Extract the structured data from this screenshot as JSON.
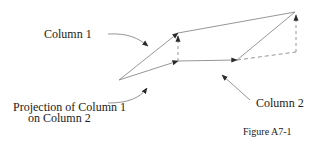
{
  "diagram": {
    "caption": "Figure A7-1",
    "labels": {
      "column1": "Column 1",
      "column2": "Column 2",
      "projection_line1": "Projection of Column 1",
      "projection_line2": "on Column 2"
    },
    "colors": {
      "line": "#8a8a8a",
      "arrowhead": "#2a2a2a",
      "text": "#222222",
      "background": "#ffffff"
    },
    "points": {
      "origin": [
        119,
        80
      ],
      "column1_tip": [
        178,
        33
      ],
      "projection_tip": [
        178,
        61
      ],
      "apex": [
        295,
        12
      ],
      "baseline_right": [
        237,
        61
      ],
      "dashed_corner": [
        296,
        52
      ]
    }
  }
}
